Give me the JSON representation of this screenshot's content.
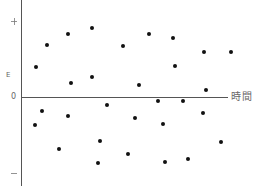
{
  "chart_data": {
    "type": "scatter",
    "title": "",
    "xlabel": "時間",
    "ylabel": "E",
    "y_tick_labels": {
      "top": "+",
      "zero": "0",
      "bottom": "−"
    },
    "grid": false,
    "legend": null,
    "xlim": [
      0,
      100
    ],
    "ylim": [
      -1,
      1
    ],
    "note": "Unitless qualitative plot: points scattered randomly above and below the zero line over time",
    "points": [
      {
        "x": 7,
        "y": 0.4
      },
      {
        "x": 13,
        "y": 0.69
      },
      {
        "x": 23,
        "y": 0.83
      },
      {
        "x": 34,
        "y": 0.91
      },
      {
        "x": 24,
        "y": 0.18
      },
      {
        "x": 34,
        "y": 0.26
      },
      {
        "x": 49,
        "y": 0.67
      },
      {
        "x": 62,
        "y": 0.83
      },
      {
        "x": 73,
        "y": 0.78
      },
      {
        "x": 88,
        "y": 0.59
      },
      {
        "x": 74,
        "y": 0.41
      },
      {
        "x": 57,
        "y": 0.16
      },
      {
        "x": 89,
        "y": 0.09
      },
      {
        "x": 101,
        "y": 0.59
      },
      {
        "x": 7,
        "y": -0.37
      },
      {
        "x": 10,
        "y": -0.18
      },
      {
        "x": 23,
        "y": -0.25
      },
      {
        "x": 19,
        "y": -0.68
      },
      {
        "x": 41,
        "y": -0.11
      },
      {
        "x": 38,
        "y": -0.58
      },
      {
        "x": 37,
        "y": -0.87
      },
      {
        "x": 51,
        "y": -0.75
      },
      {
        "x": 55,
        "y": -0.28
      },
      {
        "x": 68,
        "y": -0.36
      },
      {
        "x": 66,
        "y": -0.05
      },
      {
        "x": 78,
        "y": -0.05
      },
      {
        "x": 69,
        "y": -0.86
      },
      {
        "x": 80,
        "y": -0.82
      },
      {
        "x": 88,
        "y": -0.21
      },
      {
        "x": 96,
        "y": -0.59
      }
    ]
  },
  "render": {
    "dot_color": "#111111",
    "axis_color": "#555555",
    "pixel_points": [
      [
        36,
        67
      ],
      [
        47,
        45
      ],
      [
        68,
        34
      ],
      [
        92,
        28
      ],
      [
        71,
        83
      ],
      [
        92,
        77
      ],
      [
        123,
        46
      ],
      [
        149,
        34
      ],
      [
        173,
        38
      ],
      [
        204,
        52
      ],
      [
        175,
        66
      ],
      [
        139,
        85
      ],
      [
        206,
        90
      ],
      [
        231,
        52
      ],
      [
        35,
        125
      ],
      [
        42,
        111
      ],
      [
        68,
        116
      ],
      [
        59,
        149
      ],
      [
        107,
        105
      ],
      [
        100,
        141
      ],
      [
        98,
        163
      ],
      [
        128,
        154
      ],
      [
        135,
        118
      ],
      [
        163,
        124
      ],
      [
        158,
        101
      ],
      [
        183,
        101
      ],
      [
        165,
        162
      ],
      [
        188,
        159
      ],
      [
        203,
        113
      ],
      [
        221,
        142
      ]
    ]
  }
}
